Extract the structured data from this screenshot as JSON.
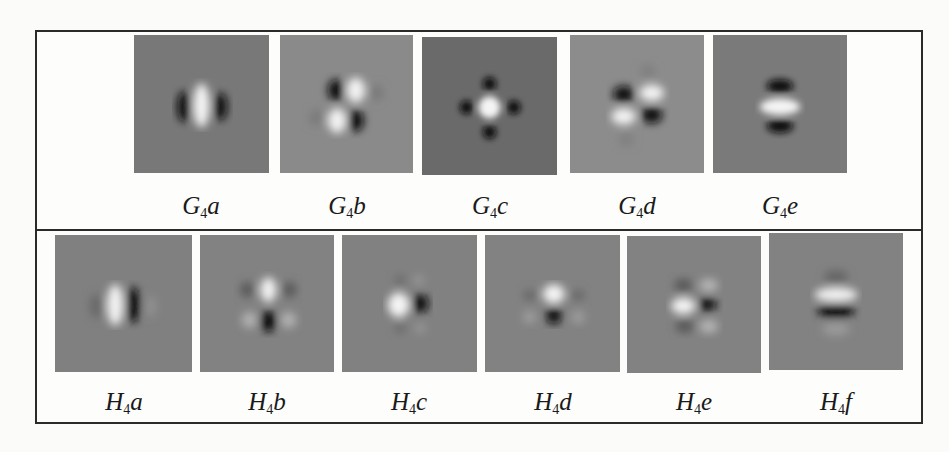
{
  "figure": {
    "top_row": {
      "name": "steerable-second-derivative-gaussian-basis",
      "items": [
        {
          "id": "G4a",
          "base": "G",
          "sub": "4",
          "suffix": "a",
          "bg": "#787878",
          "pattern": "vertical-dark-light-dark"
        },
        {
          "id": "G4b",
          "base": "G",
          "sub": "4",
          "suffix": "b",
          "bg": "#8a8a8a",
          "pattern": "diagonal-quad"
        },
        {
          "id": "G4c",
          "base": "G",
          "sub": "4",
          "suffix": "c",
          "bg": "#6a6a6a",
          "pattern": "center-light-four-dark"
        },
        {
          "id": "G4d",
          "base": "G",
          "sub": "4",
          "suffix": "d",
          "bg": "#8c8c8c",
          "pattern": "horizontal-quad"
        },
        {
          "id": "G4e",
          "base": "G",
          "sub": "4",
          "suffix": "e",
          "bg": "#7a7a7a",
          "pattern": "horizontal-dark-light-dark"
        }
      ]
    },
    "bottom_row": {
      "name": "steerable-hilbert-transform-basis",
      "items": [
        {
          "id": "H4a",
          "base": "H",
          "sub": "4",
          "suffix": "a",
          "bg": "#808080",
          "pattern": "vertical-light-dark"
        },
        {
          "id": "H4b",
          "base": "H",
          "sub": "4",
          "suffix": "b",
          "bg": "#828282",
          "pattern": "top-light-bottom-dark-cross"
        },
        {
          "id": "H4c",
          "base": "H",
          "sub": "4",
          "suffix": "c",
          "bg": "#818181",
          "pattern": "left-light-right-dark"
        },
        {
          "id": "H4d",
          "base": "H",
          "sub": "4",
          "suffix": "d",
          "bg": "#828282",
          "pattern": "top-light-bottom-dark"
        },
        {
          "id": "H4e",
          "base": "H",
          "sub": "4",
          "suffix": "e",
          "bg": "#828282",
          "pattern": "left-light-right-dark-cross"
        },
        {
          "id": "H4f",
          "base": "H",
          "sub": "4",
          "suffix": "f",
          "bg": "#828282",
          "pattern": "horizontal-light-dark"
        }
      ],
      "last_label_display": "H4f"
    }
  }
}
